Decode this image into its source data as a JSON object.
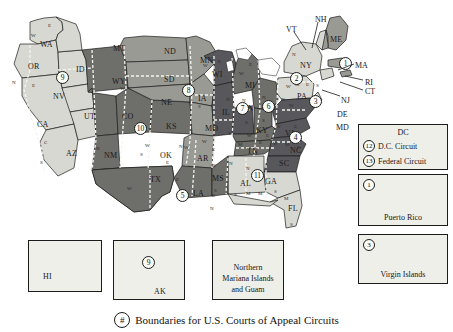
{
  "figure": {
    "caption_symbol": "#",
    "caption_text": "Boundaries for U.S. Courts of Appeal Circuits"
  },
  "map": {
    "title": "U.S. Courts of Appeal Circuits map",
    "colors": {
      "light_fill": "#d8d8d2",
      "mid_fill": "#9a9a95",
      "dark_fill": "#6e6e6a",
      "darker_fill": "#56565a",
      "outline": "#1c1c1c",
      "background": "#ffffff",
      "badge_fill": "#fbfbf8"
    },
    "states": [
      {
        "abbr": "WA",
        "x": 40,
        "y": 41
      },
      {
        "abbr": "OR",
        "x": 28,
        "y": 63
      },
      {
        "abbr": "ID",
        "x": 76,
        "y": 66
      },
      {
        "abbr": "MT",
        "x": 113,
        "y": 45
      },
      {
        "abbr": "ND",
        "x": 164,
        "y": 48
      },
      {
        "abbr": "MN",
        "x": 200,
        "y": 57
      },
      {
        "abbr": "SD",
        "x": 164,
        "y": 76
      },
      {
        "abbr": "WI",
        "x": 212,
        "y": 71
      },
      {
        "abbr": "NV",
        "x": 53,
        "y": 93
      },
      {
        "abbr": "WY",
        "x": 112,
        "y": 78
      },
      {
        "abbr": "NE",
        "x": 161,
        "y": 99
      },
      {
        "abbr": "IA",
        "x": 198,
        "y": 95
      },
      {
        "abbr": "MI",
        "x": 245,
        "y": 82
      },
      {
        "abbr": "NY",
        "x": 300,
        "y": 62
      },
      {
        "abbr": "ME",
        "x": 330,
        "y": 36
      },
      {
        "abbr": "UT",
        "x": 84,
        "y": 113
      },
      {
        "abbr": "CO",
        "x": 122,
        "y": 113
      },
      {
        "abbr": "KS",
        "x": 166,
        "y": 123
      },
      {
        "abbr": "MO",
        "x": 205,
        "y": 125
      },
      {
        "abbr": "IL",
        "x": 222,
        "y": 109
      },
      {
        "abbr": "IN",
        "x": 245,
        "y": 105
      },
      {
        "abbr": "OH",
        "x": 264,
        "y": 104
      },
      {
        "abbr": "PA",
        "x": 297,
        "y": 93
      },
      {
        "abbr": "CA",
        "x": 37,
        "y": 121
      },
      {
        "abbr": "AZ",
        "x": 66,
        "y": 150
      },
      {
        "abbr": "NM",
        "x": 104,
        "y": 152
      },
      {
        "abbr": "OK",
        "x": 160,
        "y": 152
      },
      {
        "abbr": "AR",
        "x": 197,
        "y": 155
      },
      {
        "abbr": "KY",
        "x": 256,
        "y": 127
      },
      {
        "abbr": "TN",
        "x": 247,
        "y": 148
      },
      {
        "abbr": "MS",
        "x": 212,
        "y": 175
      },
      {
        "abbr": "AL",
        "x": 240,
        "y": 180
      },
      {
        "abbr": "GA",
        "x": 265,
        "y": 178
      },
      {
        "abbr": "SC",
        "x": 279,
        "y": 160
      },
      {
        "abbr": "NC",
        "x": 290,
        "y": 147
      },
      {
        "abbr": "VA",
        "x": 285,
        "y": 130
      },
      {
        "abbr": "LA",
        "x": 193,
        "y": 190
      },
      {
        "abbr": "TX",
        "x": 150,
        "y": 176
      },
      {
        "abbr": "FL",
        "x": 288,
        "y": 205
      },
      {
        "abbr": "HI",
        "x": 40,
        "y": 275
      },
      {
        "abbr": "AK",
        "x": 155,
        "y": 290
      }
    ],
    "northeast_labels": [
      {
        "abbr": "NH",
        "x": 315,
        "y": 16
      },
      {
        "abbr": "VT",
        "x": 286,
        "y": 26
      },
      {
        "abbr": "MA",
        "x": 355,
        "y": 62
      },
      {
        "abbr": "RI",
        "x": 365,
        "y": 79
      },
      {
        "abbr": "CT",
        "x": 365,
        "y": 88
      },
      {
        "abbr": "NJ",
        "x": 341,
        "y": 97
      },
      {
        "abbr": "DE",
        "x": 337,
        "y": 111
      },
      {
        "abbr": "MD",
        "x": 336,
        "y": 124
      }
    ],
    "district_letters": [
      {
        "ch": "E",
        "x": 48,
        "y": 23
      },
      {
        "ch": "W",
        "x": 31,
        "y": 33
      },
      {
        "ch": "N",
        "x": 12,
        "y": 80
      },
      {
        "ch": "E",
        "x": 32,
        "y": 83
      },
      {
        "ch": "C",
        "x": 44,
        "y": 140
      },
      {
        "ch": "S",
        "x": 40,
        "y": 160
      },
      {
        "ch": "W",
        "x": 120,
        "y": 86
      },
      {
        "ch": "N",
        "x": 96,
        "y": 146
      },
      {
        "ch": "S",
        "x": 140,
        "y": 152
      },
      {
        "ch": "W",
        "x": 145,
        "y": 143
      },
      {
        "ch": "E",
        "x": 166,
        "y": 160
      },
      {
        "ch": "N",
        "x": 179,
        "y": 144
      },
      {
        "ch": "W",
        "x": 127,
        "y": 186
      },
      {
        "ch": "E",
        "x": 176,
        "y": 177
      },
      {
        "ch": "W",
        "x": 184,
        "y": 145
      },
      {
        "ch": "E",
        "x": 212,
        "y": 147
      },
      {
        "ch": "W",
        "x": 202,
        "y": 139
      },
      {
        "ch": "W",
        "x": 181,
        "y": 192
      },
      {
        "ch": "E",
        "x": 212,
        "y": 193
      },
      {
        "ch": "W",
        "x": 203,
        "y": 63
      },
      {
        "ch": "E",
        "x": 218,
        "y": 59
      },
      {
        "ch": "W",
        "x": 239,
        "y": 71
      },
      {
        "ch": "E",
        "x": 249,
        "y": 62
      },
      {
        "ch": "N",
        "x": 191,
        "y": 88
      },
      {
        "ch": "S",
        "x": 198,
        "y": 104
      },
      {
        "ch": "N",
        "x": 226,
        "y": 97
      },
      {
        "ch": "C",
        "x": 213,
        "y": 124
      },
      {
        "ch": "S",
        "x": 228,
        "y": 131
      },
      {
        "ch": "N",
        "x": 242,
        "y": 98
      },
      {
        "ch": "S",
        "x": 245,
        "y": 120
      },
      {
        "ch": "N",
        "x": 262,
        "y": 95
      },
      {
        "ch": "S",
        "x": 262,
        "y": 118
      },
      {
        "ch": "W",
        "x": 247,
        "y": 133
      },
      {
        "ch": "E",
        "x": 266,
        "y": 133
      },
      {
        "ch": "N",
        "x": 292,
        "y": 52
      },
      {
        "ch": "W",
        "x": 286,
        "y": 84
      },
      {
        "ch": "M",
        "x": 295,
        "y": 82
      },
      {
        "ch": "E",
        "x": 306,
        "y": 82
      },
      {
        "ch": "S",
        "x": 316,
        "y": 83
      },
      {
        "ch": "W",
        "x": 289,
        "y": 103
      },
      {
        "ch": "N",
        "x": 281,
        "y": 97
      },
      {
        "ch": "W",
        "x": 276,
        "y": 124
      },
      {
        "ch": "E",
        "x": 294,
        "y": 124
      },
      {
        "ch": "M",
        "x": 238,
        "y": 142
      },
      {
        "ch": "E",
        "x": 259,
        "y": 140
      },
      {
        "ch": "W",
        "x": 273,
        "y": 141
      },
      {
        "ch": "M",
        "x": 285,
        "y": 142
      },
      {
        "ch": "E",
        "x": 297,
        "y": 145
      },
      {
        "ch": "N",
        "x": 229,
        "y": 161
      },
      {
        "ch": "N",
        "x": 212,
        "y": 163
      },
      {
        "ch": "S",
        "x": 214,
        "y": 188
      },
      {
        "ch": "S",
        "x": 234,
        "y": 192
      },
      {
        "ch": "M",
        "x": 246,
        "y": 191
      },
      {
        "ch": "N",
        "x": 246,
        "y": 166
      },
      {
        "ch": "M",
        "x": 258,
        "y": 191
      },
      {
        "ch": "S",
        "x": 274,
        "y": 189
      },
      {
        "ch": "M",
        "x": 284,
        "y": 196
      },
      {
        "ch": "S",
        "x": 290,
        "y": 222
      },
      {
        "ch": "N",
        "x": 210,
        "y": 206
      }
    ],
    "circuits": [
      {
        "num": "9",
        "x": 56,
        "y": 71
      },
      {
        "num": "10",
        "x": 134,
        "y": 122
      },
      {
        "num": "8",
        "x": 182,
        "y": 84
      },
      {
        "num": "7",
        "x": 236,
        "y": 102
      },
      {
        "num": "6",
        "x": 262,
        "y": 100
      },
      {
        "num": "5",
        "x": 176,
        "y": 189
      },
      {
        "num": "11",
        "x": 251,
        "y": 169
      },
      {
        "num": "4",
        "x": 289,
        "y": 131
      },
      {
        "num": "3",
        "x": 309,
        "y": 95
      },
      {
        "num": "2",
        "x": 290,
        "y": 72
      },
      {
        "num": "1",
        "x": 339,
        "y": 57
      }
    ]
  },
  "legend_dc": {
    "title": "DC",
    "rows": [
      {
        "num": "12",
        "label": "D.C. Circuit"
      },
      {
        "num": "13",
        "label": "Federal  Circuit"
      }
    ]
  },
  "insets": [
    {
      "name": "puerto-rico",
      "num": "1",
      "label": "Puerto Rico"
    },
    {
      "name": "virgin-islands",
      "num": "3",
      "label": "Virgin Islands"
    },
    {
      "name": "hawaii",
      "num": "",
      "label": "HI"
    },
    {
      "name": "alaska",
      "num": "9",
      "label": "AK"
    },
    {
      "name": "mariana-guam",
      "num": "",
      "label": "Northern\nMariana Islands\nand Guam"
    }
  ],
  "inset_text": {
    "puerto_rico": "Puerto Rico",
    "virgin_islands": "Virgin Islands",
    "hawaii": "HI",
    "alaska": "AK",
    "mariana_l1": "Northern",
    "mariana_l2": "Mariana Islands",
    "mariana_l3": "and Guam",
    "pr_num": "1",
    "vi_num": "3",
    "ak_num": "9"
  }
}
